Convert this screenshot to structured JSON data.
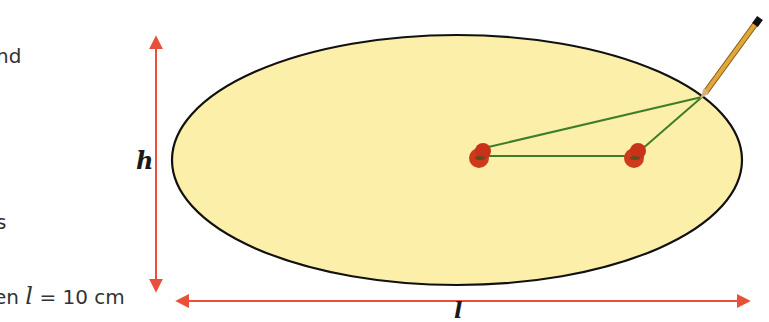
{
  "text_fragments": {
    "line1": "nd",
    "line2": "s",
    "line3_prefix": "en ",
    "line3_var": "l",
    "line3_suffix": " = 10 cm"
  },
  "labels": {
    "height": "h",
    "length": "l"
  },
  "diagram": {
    "ellipse": {
      "cx": 457,
      "cy": 160,
      "rx": 285,
      "ry": 125,
      "fill": "#fbefa9",
      "stroke": "#111111"
    },
    "pins": [
      {
        "x": 480,
        "y": 155
      },
      {
        "x": 633,
        "y": 155
      }
    ],
    "pencil_tip": {
      "x": 702,
      "y": 97
    },
    "string_color": "#3f7d2a",
    "pin_color": "#d03a1c",
    "arrow_color": "#e8503a"
  }
}
